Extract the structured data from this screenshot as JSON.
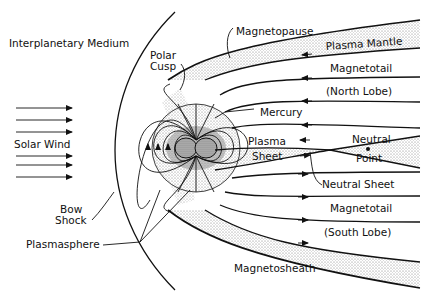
{
  "diagram": {
    "colors": {
      "ink": "#111111",
      "background": "#ffffff",
      "stipple": "#9a9a9a"
    },
    "labels": {
      "interplanetary_medium": "Interplanetary Medium",
      "polar_cusp_1": "Polar",
      "polar_cusp_2": "Cusp",
      "magnetopause": "Magnetopause",
      "plasma_mantle": "Plasma Mantle",
      "magnetotail_north_1": "Magnetotail",
      "magnetotail_north_2": "(North Lobe)",
      "mercury": "Mercury",
      "plasma_sheet_1": "Plasma",
      "plasma_sheet_2": "Sheet",
      "neutral_point_1": "Neutral",
      "neutral_point_2": "Point",
      "solar_wind": "Solar Wind",
      "neutral_sheet": "Neutral Sheet",
      "magnetotail_south_1": "Magnetotail",
      "magnetotail_south_2": "(South Lobe)",
      "bow_shock_1": "Bow",
      "bow_shock_2": "Shock",
      "plasmasphere": "Plasmasphere",
      "magnetosheath": "Magnetosheath"
    },
    "solar_wind_arrows": 6
  }
}
